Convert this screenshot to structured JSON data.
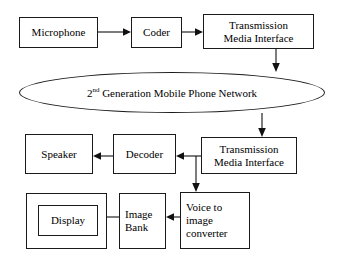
{
  "diagram": {
    "stroke_color": "#111111",
    "background_color": "#ffffff",
    "nodes": {
      "microphone": {
        "label": "Microphone"
      },
      "coder": {
        "label": "Coder"
      },
      "transmission_media_interface_tx": {
        "label": "Transmission\nMedia Interface",
        "line1": "Transmission",
        "line2": "Media Interface"
      },
      "network": {
        "prefix": "2",
        "superscript": "nd",
        "suffix": " Generation Mobile Phone Network"
      },
      "transmission_media_interface_rx": {
        "label": "Transmission\nMedia Interface",
        "line1": "Transmission",
        "line2": "Media Interface"
      },
      "decoder": {
        "label": "Decoder"
      },
      "speaker": {
        "label": "Speaker"
      },
      "voice_to_image_converter": {
        "line1": "Voice to",
        "line2": "image",
        "line3": "converter"
      },
      "image_bank": {
        "line1": "Image",
        "line2": "Bank"
      },
      "display": {
        "label": "Display"
      }
    },
    "edges": [
      {
        "from": "microphone",
        "to": "coder",
        "direction": "right"
      },
      {
        "from": "coder",
        "to": "transmission_media_interface_tx",
        "direction": "right"
      },
      {
        "from": "transmission_media_interface_tx",
        "to": "network",
        "direction": "down"
      },
      {
        "from": "network",
        "to": "transmission_media_interface_rx",
        "direction": "down"
      },
      {
        "from": "transmission_media_interface_rx",
        "to": "decoder",
        "direction": "left"
      },
      {
        "from": "transmission_media_interface_rx",
        "to": "voice_to_image_converter",
        "direction": "down"
      },
      {
        "from": "decoder",
        "to": "speaker",
        "direction": "left"
      },
      {
        "from": "voice_to_image_converter",
        "to": "image_bank",
        "direction": "left"
      },
      {
        "from": "image_bank",
        "to": "display",
        "direction": "left"
      }
    ]
  }
}
